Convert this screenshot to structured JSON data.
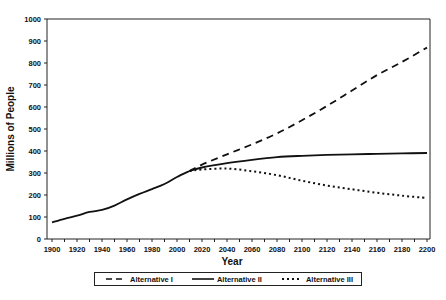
{
  "chart_data": {
    "type": "line",
    "title": "",
    "xlabel": "Year",
    "ylabel": "Millions of People",
    "xlim": [
      1900,
      2200
    ],
    "ylim": [
      0,
      1000
    ],
    "x_ticks": [
      1900,
      1920,
      1940,
      1960,
      1980,
      2000,
      2020,
      2040,
      2060,
      2080,
      2100,
      2120,
      2140,
      2160,
      2180,
      2200
    ],
    "y_ticks": [
      0,
      100,
      200,
      300,
      400,
      500,
      600,
      700,
      800,
      900,
      1000
    ],
    "grid": false,
    "legend_position": "bottom",
    "historical": {
      "name": "Historical (shared)",
      "x": [
        1900,
        1910,
        1920,
        1930,
        1940,
        1950,
        1960,
        1970,
        1980,
        1990,
        2000,
        2010
      ],
      "values": [
        76,
        92,
        106,
        123,
        132,
        152,
        180,
        205,
        227,
        250,
        282,
        309
      ]
    },
    "series": [
      {
        "name": "Alternative I",
        "style": "dashed",
        "x": [
          2010,
          2020,
          2040,
          2060,
          2080,
          2100,
          2120,
          2140,
          2160,
          2180,
          2200
        ],
        "values": [
          309,
          338,
          385,
          430,
          480,
          540,
          605,
          675,
          745,
          805,
          870
        ]
      },
      {
        "name": "Alternative II",
        "style": "solid",
        "x": [
          2010,
          2020,
          2040,
          2060,
          2080,
          2100,
          2120,
          2140,
          2160,
          2180,
          2200
        ],
        "values": [
          309,
          325,
          345,
          360,
          372,
          378,
          382,
          385,
          387,
          389,
          391
        ]
      },
      {
        "name": "Alternative III",
        "style": "dotted",
        "x": [
          2010,
          2020,
          2040,
          2060,
          2080,
          2100,
          2120,
          2140,
          2160,
          2180,
          2200
        ],
        "values": [
          309,
          316,
          320,
          308,
          290,
          265,
          243,
          226,
          210,
          197,
          186
        ]
      }
    ]
  },
  "legend": {
    "items": [
      {
        "label": "Alternative I"
      },
      {
        "label": "Alternative II"
      },
      {
        "label": "Alternative III"
      }
    ]
  }
}
